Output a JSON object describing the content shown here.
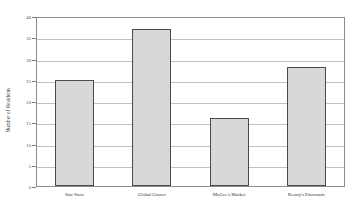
{
  "chart_data": {
    "type": "bar",
    "title": "",
    "xlabel": "",
    "ylabel": "Number of Residents",
    "categories": [
      "Star Store",
      "Global Grocer",
      "McGee's Market",
      "Kenny's Discounts"
    ],
    "values": [
      25,
      37,
      16,
      28
    ],
    "ylim": [
      0,
      40
    ],
    "ytick_values": [
      0,
      5,
      10,
      15,
      20,
      25,
      30,
      35,
      40
    ],
    "ytick_labels": [
      "0",
      "5",
      "10",
      "15",
      "20",
      "25",
      "30",
      "35",
      "40"
    ],
    "grid": true,
    "legend": "none",
    "bar_fill_color": "#d8d8d8",
    "bar_border_color": "#4a4a4a",
    "gridline_color": "#c2c2c2",
    "frame_color": "#8d8d8d",
    "background_color": "#ffffff"
  }
}
